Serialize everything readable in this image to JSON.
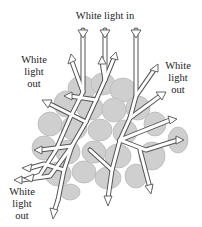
{
  "labels": {
    "light_in": "White light in",
    "out_left": [
      "White",
      "light",
      "out"
    ],
    "out_right": [
      "White",
      "light",
      "out"
    ],
    "out_bottom": [
      "White",
      "light",
      "out"
    ]
  },
  "colors": {
    "grain_fill": "#cfcfcf",
    "grain_stroke": "#b9b9b9",
    "arrow_fill": "#ffffff",
    "arrow_stroke": "#555555",
    "text": "#222222",
    "background": "#ffffff"
  },
  "diagram": {
    "incoming_rays": 3,
    "outgoing_groups": [
      "left",
      "right",
      "bottom-left"
    ]
  }
}
